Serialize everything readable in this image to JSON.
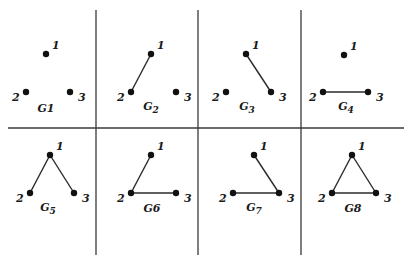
{
  "diagram": {
    "grid": {
      "vertical_lines_x": [
        96,
        198,
        301
      ],
      "vertical_span": [
        10,
        255
      ],
      "horizontal_line_y": 128,
      "horizontal_span": [
        8,
        404
      ],
      "line_color": "#3a3a3a"
    },
    "graphs": [
      {
        "name": "G1",
        "label_base": "G",
        "label_sub": "",
        "label_plain": "G1",
        "nodes": [
          {
            "id": "1",
            "x": 46,
            "y": 54
          },
          {
            "id": "2",
            "x": 26,
            "y": 92
          },
          {
            "id": "3",
            "x": 70,
            "y": 92
          }
        ],
        "edges": [],
        "label_pos": {
          "x": 46,
          "y": 112
        }
      },
      {
        "name": "G2",
        "label_base": "G",
        "label_sub": "2",
        "label_plain": "",
        "nodes": [
          {
            "id": "1",
            "x": 151,
            "y": 54
          },
          {
            "id": "2",
            "x": 131,
            "y": 92
          },
          {
            "id": "3",
            "x": 176,
            "y": 92
          }
        ],
        "edges": [
          [
            "1",
            "2"
          ]
        ],
        "label_pos": {
          "x": 151,
          "y": 110
        }
      },
      {
        "name": "G3",
        "label_base": "G",
        "label_sub": "3",
        "label_plain": "",
        "nodes": [
          {
            "id": "1",
            "x": 246,
            "y": 54
          },
          {
            "id": "2",
            "x": 226,
            "y": 92
          },
          {
            "id": "3",
            "x": 271,
            "y": 92
          }
        ],
        "edges": [
          [
            "1",
            "3"
          ]
        ],
        "label_pos": {
          "x": 247,
          "y": 110
        }
      },
      {
        "name": "G4",
        "label_base": "G",
        "label_sub": "4",
        "label_plain": "",
        "nodes": [
          {
            "id": "1",
            "x": 344,
            "y": 55
          },
          {
            "id": "2",
            "x": 323,
            "y": 92
          },
          {
            "id": "3",
            "x": 368,
            "y": 92
          }
        ],
        "edges": [
          [
            "2",
            "3"
          ]
        ],
        "label_pos": {
          "x": 346,
          "y": 110
        }
      },
      {
        "name": "G5",
        "label_base": "G",
        "label_sub": "5",
        "label_plain": "",
        "nodes": [
          {
            "id": "1",
            "x": 50,
            "y": 155
          },
          {
            "id": "2",
            "x": 30,
            "y": 193
          },
          {
            "id": "3",
            "x": 74,
            "y": 193
          }
        ],
        "edges": [
          [
            "1",
            "2"
          ],
          [
            "1",
            "3"
          ]
        ],
        "label_pos": {
          "x": 48,
          "y": 211
        }
      },
      {
        "name": "G6",
        "label_base": "G",
        "label_sub": "",
        "label_plain": "G6",
        "nodes": [
          {
            "id": "1",
            "x": 151,
            "y": 155
          },
          {
            "id": "2",
            "x": 131,
            "y": 193
          },
          {
            "id": "3",
            "x": 176,
            "y": 193
          }
        ],
        "edges": [
          [
            "1",
            "2"
          ],
          [
            "2",
            "3"
          ]
        ],
        "label_pos": {
          "x": 152,
          "y": 212
        }
      },
      {
        "name": "G7",
        "label_base": "G",
        "label_sub": "7",
        "label_plain": "",
        "nodes": [
          {
            "id": "1",
            "x": 254,
            "y": 155
          },
          {
            "id": "2",
            "x": 233,
            "y": 193
          },
          {
            "id": "3",
            "x": 279,
            "y": 193
          }
        ],
        "edges": [
          [
            "1",
            "3"
          ],
          [
            "2",
            "3"
          ]
        ],
        "label_pos": {
          "x": 254,
          "y": 211
        }
      },
      {
        "name": "G8",
        "label_base": "G",
        "label_sub": "",
        "label_plain": "G8",
        "nodes": [
          {
            "id": "1",
            "x": 352,
            "y": 155
          },
          {
            "id": "2",
            "x": 332,
            "y": 193
          },
          {
            "id": "3",
            "x": 376,
            "y": 193
          }
        ],
        "edges": [
          [
            "1",
            "2"
          ],
          [
            "1",
            "3"
          ],
          [
            "2",
            "3"
          ]
        ],
        "label_pos": {
          "x": 353,
          "y": 212
        }
      }
    ],
    "node_label_offsets": {
      "1": {
        "dx": 6,
        "dy": -5
      },
      "2": {
        "dx": -14,
        "dy": 9
      },
      "3": {
        "dx": 8,
        "dy": 9
      }
    }
  }
}
